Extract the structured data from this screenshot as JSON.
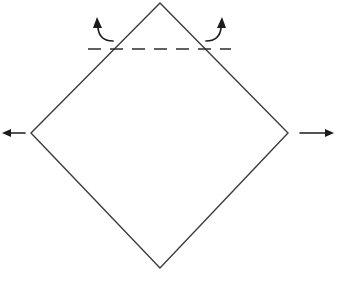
{
  "figure": {
    "background_color": "#ffffff",
    "width": 338,
    "height": 284
  },
  "diamond": {
    "name": "diamond-outline",
    "stroke_color": "#3c3c3c",
    "stroke_width": 1.4,
    "fill": "none",
    "vertices": {
      "top": [
        160,
        3
      ],
      "right": [
        288,
        133
      ],
      "bottom": [
        160,
        268
      ],
      "left": [
        31,
        133
      ]
    },
    "points_attr": "160,3 288,133 160,268 31,133"
  },
  "dashed_line": {
    "name": "dashed-cut-line",
    "stroke_color": "#2e2e2e",
    "stroke_width": 1.6,
    "dash_pattern": "13 9",
    "x1": 88,
    "y1": 49,
    "x2": 231,
    "y2": 49,
    "intersect_left": [
      112,
      49
    ],
    "intersect_right": [
      208,
      49
    ]
  },
  "arrows": {
    "stroke_color": "#1c1c1c",
    "left_pull": {
      "name": "left-pull-arrow",
      "direction": "left",
      "line_x1": 25,
      "line_x2": 9,
      "y": 133,
      "stroke_width": 1.6,
      "head_points": "2,133 11,129 11,137"
    },
    "right_pull": {
      "name": "right-pull-arrow",
      "direction": "right",
      "line_x1": 300,
      "line_x2": 327,
      "y": 133,
      "stroke_width": 1.6,
      "head_points": "334,133 325,129 325,137"
    },
    "left_curved": {
      "name": "left-curved-fold-arrow",
      "direction": "up",
      "path": "M 113,41 C 104,41 99,37 98,28",
      "stroke_width": 1.7,
      "head_points": "97,17 93,28 102,28"
    },
    "right_curved": {
      "name": "right-curved-fold-arrow",
      "direction": "up",
      "path": "M 206,41 C 215,41 220,37 221,28",
      "stroke_width": 1.7,
      "head_points": "222,17 217,28 226,28"
    }
  }
}
